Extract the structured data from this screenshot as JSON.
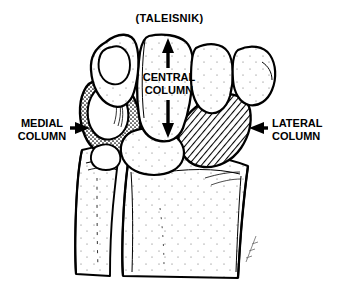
{
  "figure": {
    "title": "(TALEISNIK)",
    "background_color": "#ffffff",
    "ink_color": "#000000"
  },
  "labels": {
    "medial": "MEDIAL\nCOLUMN",
    "central": "CENTRAL\nCOLUMN",
    "lateral": "LATERAL\nCOLUMN"
  },
  "annotations": {
    "medial_arrow": "arrow-right-icon",
    "lateral_arrow": "arrow-left-icon",
    "central_arrow_up": "arrow-up-icon",
    "central_arrow_down": "arrow-down-icon"
  },
  "regions": {
    "medial_fill": "stipple",
    "central_fill": "none",
    "lateral_fill": "diagonal-hatch"
  },
  "signature": "artist-signature-mark"
}
